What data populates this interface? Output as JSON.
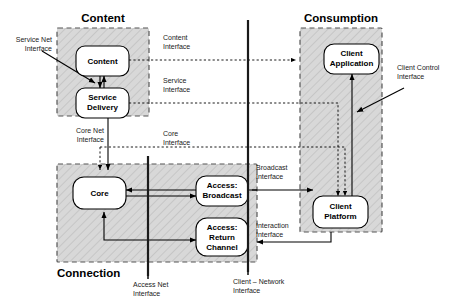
{
  "diagram": {
    "zones": [
      {
        "id": "content",
        "label": "Content"
      },
      {
        "id": "connection",
        "label": "Connection"
      },
      {
        "id": "consumption",
        "label": "Consumption"
      }
    ],
    "nodes": [
      {
        "id": "content-node",
        "label": "Content",
        "zone": "content"
      },
      {
        "id": "service-delivery",
        "label": "Service\nDelivery",
        "line1": "Service",
        "line2": "Delivery",
        "zone": "content"
      },
      {
        "id": "core",
        "label": "Core",
        "zone": "connection"
      },
      {
        "id": "access-broadcast",
        "label": "Access:\nBroadcast",
        "line1": "Access:",
        "line2": "Broadcast",
        "zone": "connection"
      },
      {
        "id": "access-return",
        "label": "Access:\nReturn\nChannel",
        "line1": "Access:",
        "line2": "Return",
        "line3": "Channel",
        "zone": "connection"
      },
      {
        "id": "client-application",
        "label": "Client\nApplication",
        "line1": "Client",
        "line2": "Application",
        "zone": "consumption"
      },
      {
        "id": "client-platform",
        "label": "Client\nPlatform",
        "line1": "Client",
        "line2": "Platform",
        "zone": "consumption"
      }
    ],
    "interfaces": [
      {
        "id": "service-net-interface",
        "line1": "Service Net",
        "line2": "Interface",
        "style": "solid-arrow"
      },
      {
        "id": "content-interface",
        "line1": "Content",
        "line2": "Interface",
        "style": "dashed"
      },
      {
        "id": "service-interface",
        "line1": "Service",
        "line2": "Interface",
        "style": "dashed"
      },
      {
        "id": "core-net-interface",
        "line1": "Core Net",
        "line2": "Interface",
        "style": "solid"
      },
      {
        "id": "core-interface",
        "line1": "Core",
        "line2": "Interface",
        "style": "dashed"
      },
      {
        "id": "client-control-interface",
        "line1": "Client Control",
        "line2": "Interface",
        "style": "solid-arrow"
      },
      {
        "id": "broadcast-interface",
        "line1": "Broadcast",
        "line2": "Interface",
        "style": "solid"
      },
      {
        "id": "interaction-interface",
        "line1": "Interaction",
        "line2": "Interface",
        "style": "solid"
      },
      {
        "id": "access-net-interface",
        "line1": "Access Net",
        "line2": "Interface",
        "style": "boundary"
      },
      {
        "id": "client-network-interface",
        "line1": "Client – Network",
        "line2": "Interface",
        "style": "boundary"
      }
    ],
    "colors": {
      "zone_fill": "#d8d8d8",
      "zone_stroke": "#555555",
      "node_fill": "#ffffff",
      "stroke": "#000000"
    }
  }
}
